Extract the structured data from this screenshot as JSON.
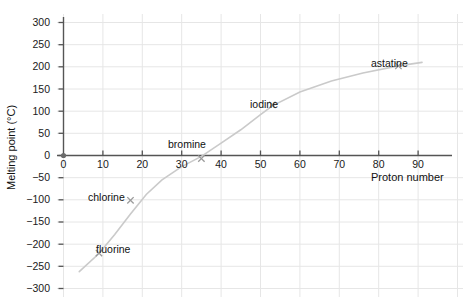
{
  "chart_data": {
    "type": "scatter",
    "title": "",
    "xlabel": "Proton number",
    "ylabel": "Melting point (°C)",
    "xlim": [
      0,
      92
    ],
    "ylim": [
      -300,
      310
    ],
    "xticks": [
      0,
      10,
      20,
      30,
      40,
      50,
      60,
      70,
      80,
      90
    ],
    "yticks": [
      -300,
      -250,
      -200,
      -150,
      -100,
      -50,
      0,
      50,
      100,
      150,
      200,
      250,
      300
    ],
    "xtick_labels": [
      "0",
      "10",
      "20",
      "30",
      "40",
      "50",
      "60",
      "70",
      "80",
      "90"
    ],
    "ytick_labels": [
      "−300",
      "−250",
      "−200",
      "−150",
      "−100",
      "−50",
      "0",
      "50",
      "100",
      "150",
      "200",
      "250",
      "300"
    ],
    "grid": true,
    "legend": "none",
    "marker": "x",
    "series": [
      {
        "name": "halogen melting points",
        "points": [
          {
            "label": "fluorine",
            "x": 9,
            "y": -220,
            "label_pos": "right"
          },
          {
            "label": "chlorine",
            "x": 17,
            "y": -101,
            "label_pos": "left"
          },
          {
            "label": "bromine",
            "x": 35,
            "y": -7,
            "label_pos": "above-left"
          },
          {
            "label": "iodine",
            "x": 53,
            "y": 114,
            "label_pos": "left"
          },
          {
            "label": "astatine",
            "x": 85,
            "y": 202,
            "label_pos": "above-left"
          }
        ]
      }
    ],
    "trend_line": {
      "description": "smooth increasing curve of best fit through the five points",
      "points": [
        {
          "x": 4,
          "y": -262
        },
        {
          "x": 9,
          "y": -221
        },
        {
          "x": 13,
          "y": -178
        },
        {
          "x": 17,
          "y": -132
        },
        {
          "x": 21,
          "y": -88
        },
        {
          "x": 25,
          "y": -55
        },
        {
          "x": 30,
          "y": -25
        },
        {
          "x": 35,
          "y": -2
        },
        {
          "x": 40,
          "y": 28
        },
        {
          "x": 45,
          "y": 58
        },
        {
          "x": 50,
          "y": 92
        },
        {
          "x": 53,
          "y": 112
        },
        {
          "x": 60,
          "y": 143
        },
        {
          "x": 68,
          "y": 168
        },
        {
          "x": 76,
          "y": 186
        },
        {
          "x": 85,
          "y": 202
        },
        {
          "x": 91,
          "y": 210
        }
      ]
    }
  },
  "colors": {
    "background": "#ffffff",
    "axis": "#4d4d4d",
    "grid": "#e3e3e3",
    "curve": "#c9c9c9",
    "marker": "#8c8c8c",
    "text": "#111111"
  },
  "labels": {
    "x_axis_title": "Proton number",
    "y_axis_title": "Melting point (°C)",
    "points": {
      "fluorine": "fluorine",
      "chlorine": "chlorine",
      "bromine": "bromine",
      "iodine": "iodine",
      "astatine": "astatine"
    }
  },
  "ticks": {
    "x": [
      "0",
      "10",
      "20",
      "30",
      "40",
      "50",
      "60",
      "70",
      "80",
      "90"
    ],
    "y": [
      "300",
      "250",
      "200",
      "150",
      "100",
      "50",
      "0",
      "−50",
      "−100",
      "−150",
      "−200",
      "−250",
      "−300"
    ]
  }
}
